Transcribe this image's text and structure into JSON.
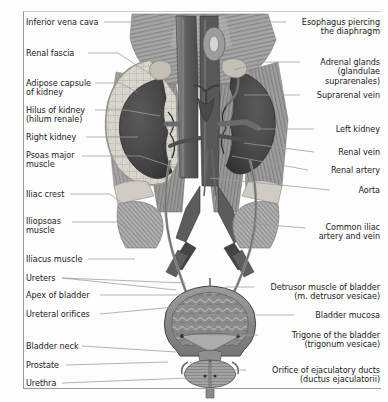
{
  "figure": {
    "type": "anatomical-illustration",
    "style": "grayscale medical atlas plate"
  },
  "colors": {
    "background": "#fdfdfd",
    "frame": "#9a9a9a",
    "text": "#1a1a1a",
    "leader_line": "#9b9b9b",
    "kidney": "#4b4b4b",
    "kidney_dark": "#3a3a3a",
    "adipose_capsule": "#d8d5cd",
    "renal_fascia": "#bdbab2",
    "muscle": "#8e8e8e",
    "muscle_light": "#a9a9a9",
    "vessel_dark": "#5f5f5f",
    "vessel_mid": "#707070",
    "bladder": "#8a8a8a",
    "bladder_mucosa": "#6f6f6f",
    "prostate": "#9a9a9a",
    "bone": "#cfcbc2"
  },
  "labels_left": [
    {
      "id": "inferior-vena-cava",
      "text": "Inferior vena cava",
      "lines": [
        "Inferior vena cava"
      ],
      "x": 26,
      "y": 18
    },
    {
      "id": "renal-fascia",
      "text": "Renal fascia",
      "lines": [
        "Renal fascia"
      ],
      "x": 26,
      "y": 49
    },
    {
      "id": "adipose-capsule-of-kidney",
      "text": "Adipose capsule of kidney",
      "lines": [
        "Adipose capsule",
        "of kidney"
      ],
      "x": 26,
      "y": 79
    },
    {
      "id": "hilus-of-kidney",
      "text": "Hilus of kidney (hilum renale)",
      "lines": [
        "Hilus of kidney",
        "(hilum renale)"
      ],
      "x": 26,
      "y": 106
    },
    {
      "id": "right-kidney",
      "text": "Right kidney",
      "lines": [
        "Right kidney"
      ],
      "x": 26,
      "y": 133
    },
    {
      "id": "psoas-major-muscle",
      "text": "Psoas major muscle",
      "lines": [
        "Psoas major",
        "muscle"
      ],
      "x": 26,
      "y": 151
    },
    {
      "id": "iliac-crest",
      "text": "Iliac crest",
      "lines": [
        "Iliac crest"
      ],
      "x": 26,
      "y": 190
    },
    {
      "id": "iliopsoas-muscle",
      "text": "Iliopsoas muscle",
      "lines": [
        "Iliopsoas",
        "muscle"
      ],
      "x": 26,
      "y": 217
    },
    {
      "id": "iliacus-muscle",
      "text": "Iliacus muscle",
      "lines": [
        "Iliacus muscle"
      ],
      "x": 26,
      "y": 255
    },
    {
      "id": "ureters",
      "text": "Ureters",
      "lines": [
        "Ureters"
      ],
      "x": 26,
      "y": 274
    },
    {
      "id": "apex-of-bladder",
      "text": "Apex of bladder",
      "lines": [
        "Apex of bladder"
      ],
      "x": 26,
      "y": 291
    },
    {
      "id": "ureteral-orifices",
      "text": "Ureteral orifices",
      "lines": [
        "Ureteral orifices"
      ],
      "x": 26,
      "y": 310
    },
    {
      "id": "bladder-neck",
      "text": "Bladder neck",
      "lines": [
        "Bladder neck"
      ],
      "x": 26,
      "y": 342
    },
    {
      "id": "prostate",
      "text": "Prostate",
      "lines": [
        "Prostate"
      ],
      "x": 26,
      "y": 361
    },
    {
      "id": "urethra",
      "text": "Urethra",
      "lines": [
        "Urethra"
      ],
      "x": 26,
      "y": 379
    }
  ],
  "labels_right": [
    {
      "id": "esophagus-piercing-the-diaphragm",
      "text": "Esophagus piercing the diaphragm",
      "lines": [
        "Esophagus piercing",
        "the diaphragm"
      ],
      "right": 8,
      "y": 18
    },
    {
      "id": "adrenal-glands",
      "text": "Adrenal glands (glandulae suprarenales)",
      "lines": [
        "Adrenal glands",
        "(glandulae",
        "suprarenales)"
      ],
      "right": 8,
      "y": 58
    },
    {
      "id": "suprarenal-vein",
      "text": "Suprarenal vein",
      "lines": [
        "Suprarenal vein"
      ],
      "right": 8,
      "y": 91
    },
    {
      "id": "left-kidney",
      "text": "Left kidney",
      "lines": [
        "Left kidney"
      ],
      "right": 8,
      "y": 125
    },
    {
      "id": "renal-vein",
      "text": "Renal vein",
      "lines": [
        "Renal vein"
      ],
      "right": 8,
      "y": 148
    },
    {
      "id": "renal-artery",
      "text": "Renal artery",
      "lines": [
        "Renal artery"
      ],
      "right": 8,
      "y": 166
    },
    {
      "id": "aorta",
      "text": "Aorta",
      "lines": [
        "Aorta"
      ],
      "right": 8,
      "y": 186
    },
    {
      "id": "common-iliac-artery-and-vein",
      "text": "Common iliac artery and vein",
      "lines": [
        "Common iliac",
        "artery and vein"
      ],
      "right": 8,
      "y": 223
    },
    {
      "id": "detrusor-muscle-of-bladder",
      "text": "Detrusor muscle of bladder (m. detrusor vesicae)",
      "lines": [
        "Detrusor muscle of bladder",
        "(m. detrusor vesicae)"
      ],
      "right": 8,
      "y": 283
    },
    {
      "id": "bladder-mucosa",
      "text": "Bladder mucosa",
      "lines": [
        "Bladder mucosa"
      ],
      "right": 8,
      "y": 311
    },
    {
      "id": "trigone-of-the-bladder",
      "text": "Trigone of the bladder (trigonum vesicae)",
      "lines": [
        "Trigone of the bladder",
        "(trigonum vesicae)"
      ],
      "right": 8,
      "y": 331
    },
    {
      "id": "orifice-of-ejaculatory-ducts",
      "text": "Orifice of ejaculatory ducts (ductus ejaculatorii)",
      "lines": [
        "Orifice of ejaculatory ducts",
        "(ductus ejaculatorii)"
      ],
      "right": 8,
      "y": 366
    }
  ],
  "leader_lines": [
    {
      "id": "leader-inferior-vena-cava",
      "path": "M104,22 L175,22"
    },
    {
      "id": "leader-renal-fascia",
      "path": "M88,53 L118,53 L150,74"
    },
    {
      "id": "leader-adipose-capsule",
      "path": "M95,83 L120,83 L137,92"
    },
    {
      "id": "leader-hilus-of-kidney",
      "path": "M95,110 L125,110 L160,116"
    },
    {
      "id": "leader-right-kidney",
      "path": "M86,137 L138,137"
    },
    {
      "id": "leader-psoas-major",
      "path": "M82,156 L140,156 L176,168"
    },
    {
      "id": "leader-iliac-crest",
      "path": "M70,194 L110,194 L124,205"
    },
    {
      "id": "leader-iliopsoas",
      "path": "M72,222 L118,222 L150,244"
    },
    {
      "id": "leader-iliacus",
      "path": "M88,259 L135,259"
    },
    {
      "id": "leader-ureters-a",
      "path": "M62,278 L176,290"
    },
    {
      "id": "leader-ureters-b",
      "path": "M62,278 L186,283"
    },
    {
      "id": "leader-apex-of-bladder",
      "path": "M100,295 L186,295"
    },
    {
      "id": "leader-ureteral-orifices",
      "path": "M100,314 L196,305"
    },
    {
      "id": "leader-bladder-neck",
      "path": "M82,346 L176,352"
    },
    {
      "id": "leader-prostate",
      "path": "M66,365 L168,362"
    },
    {
      "id": "leader-urethra",
      "path": "M62,383 L190,378"
    },
    {
      "id": "leader-esophagus",
      "path": "M286,22 L248,22 L214,36"
    },
    {
      "id": "leader-adrenal-glands",
      "path": "M300,62 L262,62 L234,70"
    },
    {
      "id": "leader-suprarenal-vein",
      "path": "M300,95 L244,95"
    },
    {
      "id": "leader-left-kidney",
      "path": "M314,129 L258,129"
    },
    {
      "id": "leader-renal-vein",
      "path": "M314,152 L244,143"
    },
    {
      "id": "leader-renal-artery",
      "path": "M308,170 L232,156"
    },
    {
      "id": "leader-aorta",
      "path": "M330,190 L210,178"
    },
    {
      "id": "leader-common-iliac",
      "path": "M306,228 L232,222"
    },
    {
      "id": "leader-detrusor",
      "path": "M254,287 L226,287 L206,300"
    },
    {
      "id": "leader-bladder-mucosa",
      "path": "M294,315 L196,315"
    },
    {
      "id": "leader-trigone",
      "path": "M258,335 L210,335"
    },
    {
      "id": "leader-orifice-ejaculatory",
      "path": "M246,370 L204,370 L190,362"
    }
  ]
}
